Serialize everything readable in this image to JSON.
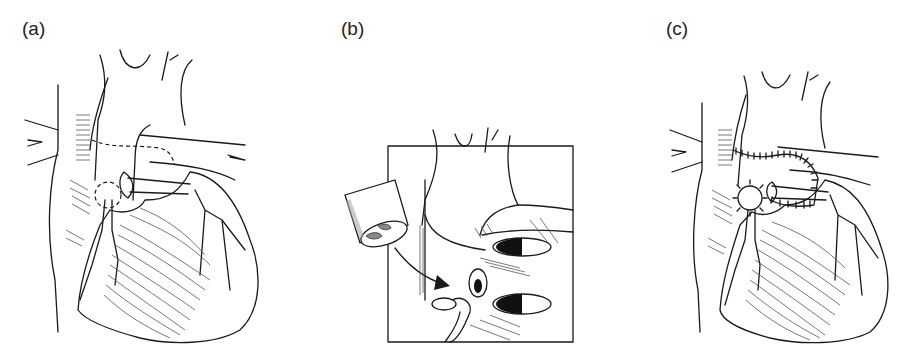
{
  "figure": {
    "panels": [
      {
        "id": "a",
        "label": "(a)",
        "description": "Heart anterior view with dashed excision lines around aortic root and coronary ostium"
      },
      {
        "id": "b",
        "label": "(b)",
        "description": "Inset box showing aortic root homograft cylinder with arrow indicating implantation near coronary ostia"
      },
      {
        "id": "c",
        "label": "(c)",
        "description": "Heart anterior view after aortic root replacement with sutured anastomoses and coronary button reimplantation"
      }
    ]
  }
}
